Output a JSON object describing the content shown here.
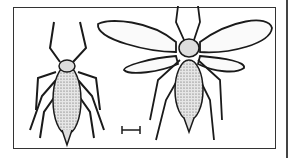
{
  "figure": {
    "panels": [
      {
        "name": "wingless-aphid",
        "description": "Wingless aphid, dorsal view"
      },
      {
        "name": "winged-aphid",
        "description": "Winged aphid, dorsal view"
      }
    ],
    "scale_bar": {
      "present": true,
      "label": ""
    }
  },
  "colors": {
    "ink": "#1a1a1a",
    "body_fill": "#cfcfcf",
    "background": "#ffffff"
  }
}
